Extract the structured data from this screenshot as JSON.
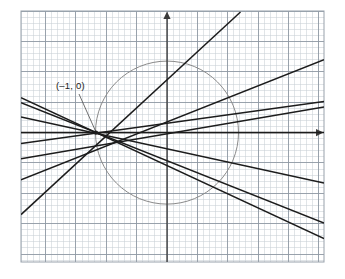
{
  "figure": {
    "kind": "coordinate-grid-graph",
    "background_color": "#ffffff",
    "grid_minor_color": "#c9cfd6",
    "grid_major_color": "#8e98a3",
    "grid_border_color": "#8e98a3",
    "axis_color": "#3a3a3a",
    "line_color": "#1c1c1c",
    "circle_color": "#8a8a8a"
  },
  "annotations": [
    {
      "name": "point-label-minus-one-zero",
      "text": "(–1, 0)",
      "x": 56,
      "y": 81,
      "leader_from": [
        79,
        94
      ],
      "leader_to": [
        95.5,
        131
      ]
    }
  ],
  "chart_data": {
    "type": "line",
    "title": "",
    "subtitle": "",
    "xlabel": "",
    "ylabel": "",
    "grid": true,
    "legend_position": "none",
    "axis_arrows": [
      "x-positive",
      "y-positive"
    ],
    "units_per_major_cell": 1,
    "minor_cells_per_major": 5,
    "pixels_per_minor_cell": 6.07,
    "origin_px": [
      167.0,
      132.6
    ],
    "grid_bounds_px": {
      "left": 21,
      "top": 11,
      "right": 324,
      "bottom": 262
    },
    "common_point": {
      "label": "(–1, 0)",
      "x": -1,
      "y": 0,
      "px": [
        95.9,
        132.6
      ]
    },
    "xlim": [
      -4.81,
      5.18
    ],
    "ylim": [
      -4.27,
      4.01
    ],
    "circle": {
      "name": "unit-ish-circle",
      "center": [
        0,
        0
      ],
      "center_px": [
        167.0,
        132.6
      ],
      "radius": 2.35,
      "radius_px": 71.5,
      "color": "#8a8a8a",
      "stroke_width": 1
    },
    "series": [
      {
        "name": "line-steep-positive",
        "slope": 1.58,
        "intercept": 1.58,
        "px_start": [
          21.0,
          214.6
        ],
        "px_end": [
          240.5,
          12.0
        ]
      },
      {
        "name": "line-upper-positive",
        "slope": 0.6,
        "intercept": 0.6,
        "px_start": [
          21.0,
          179.9
        ],
        "px_end": [
          324.0,
          59.6
        ]
      },
      {
        "name": "line-mid-positive",
        "slope": 0.34,
        "intercept": 0.34,
        "px_start": [
          21.0,
          158.8
        ],
        "px_end": [
          324.0,
          107.1
        ]
      },
      {
        "name": "line-shallow-positive",
        "slope": 0.145,
        "intercept": 0.145,
        "px_start": [
          21.0,
          143.5
        ],
        "px_end": [
          324.0,
          101.6
        ]
      },
      {
        "name": "line-horizontal",
        "slope": 0,
        "intercept": 0,
        "px_start": [
          21.0,
          132.6
        ],
        "px_end": [
          324.0,
          132.6
        ]
      },
      {
        "name": "line-shallow-negative",
        "slope": -0.21,
        "intercept": -0.21,
        "px_start": [
          21.0,
          117.0
        ],
        "px_end": [
          324.0,
          183.0
        ]
      },
      {
        "name": "line-steeper-negative",
        "slope": -0.4,
        "intercept": -0.4,
        "px_start": [
          21.0,
          102.6
        ],
        "px_end": [
          324.0,
          223.0
        ]
      },
      {
        "name": "line-steepest-negative",
        "slope": -0.465,
        "intercept": -0.465,
        "px_start": [
          21.0,
          97.6
        ],
        "px_end": [
          324.0,
          238.6
        ]
      }
    ]
  }
}
